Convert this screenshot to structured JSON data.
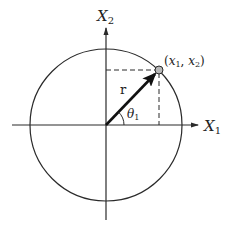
{
  "diagram": {
    "title": "",
    "colors": {
      "stroke": "#2a2a2a",
      "point_fill": "#b8b8b8",
      "background": "#ffffff"
    },
    "axes": {
      "x_label": {
        "base": "X",
        "sub": "1"
      },
      "y_label": {
        "base": "X",
        "sub": "2"
      }
    },
    "vector_label": "r",
    "angle_label": {
      "base": "θ",
      "sub": "1"
    },
    "point_label": {
      "open": "(",
      "x_base": "x",
      "x_sub": "1",
      "sep": ", ",
      "y_base": "x",
      "y_sub": "2",
      "close": ")"
    }
  }
}
